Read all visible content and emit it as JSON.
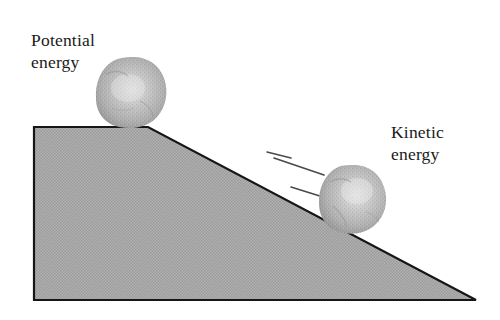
{
  "figure": {
    "background_color": "#ffffff",
    "width": 500,
    "height": 320
  },
  "labels": {
    "potential": {
      "line1": "Potential",
      "line2": "energy"
    },
    "kinetic": {
      "line1": "Kinetic",
      "line2": "energy"
    }
  },
  "ramp": {
    "name": "slope-ramp",
    "fill_color": "#a9a9a9",
    "outline_color": "#161616",
    "points": "34,127 148,127 476,300 34,300",
    "top_left": [
      34,
      127
    ],
    "apex": [
      148,
      127
    ],
    "bottom_right": [
      476,
      300
    ],
    "bottom_left": [
      34,
      300
    ]
  },
  "rocks": [
    {
      "name": "rock-potential",
      "label": "Potential energy rock",
      "center": [
        131,
        93
      ],
      "radius": 35,
      "fill_color": "#b0b0b0",
      "highlight_color": "#dedede",
      "shadow_color": "#8c8c8c"
    },
    {
      "name": "rock-kinetic",
      "label": "Kinetic energy rock",
      "center": [
        352,
        197
      ],
      "radius": 33,
      "fill_color": "#b0b0b0",
      "highlight_color": "#dedede",
      "shadow_color": "#8c8c8c"
    }
  ],
  "motion_lines": {
    "name": "motion-speed-lines",
    "color": "#4a4a4a",
    "count": 3,
    "lines": [
      {
        "x1": 267,
        "y1": 152,
        "x2": 291,
        "y2": 158
      },
      {
        "x1": 274,
        "y1": 158,
        "x2": 324,
        "y2": 175
      },
      {
        "x1": 291,
        "y1": 187,
        "x2": 323,
        "y2": 197
      }
    ]
  }
}
